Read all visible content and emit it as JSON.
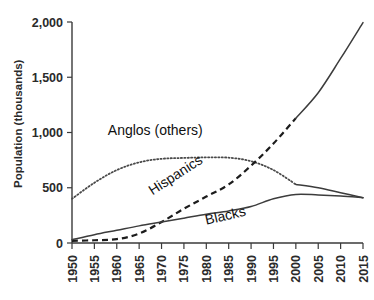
{
  "chart_data": {
    "type": "line",
    "title": "",
    "xlabel": "",
    "ylabel": "Population (thousands)",
    "xlim": [
      1950,
      2015
    ],
    "ylim": [
      0,
      2000
    ],
    "grid": false,
    "legend_position": "inline-annotations",
    "x": [
      1950,
      1955,
      1960,
      1965,
      1970,
      1975,
      1980,
      1985,
      1990,
      1995,
      2000,
      2005,
      2010,
      2015
    ],
    "xticklabels": [
      "1950",
      "1955",
      "1960",
      "1965",
      "1970",
      "1975",
      "1980",
      "1985",
      "1990",
      "1995",
      "2000",
      "2005",
      "2010",
      "2015"
    ],
    "yticks": [
      0,
      500,
      1000,
      1500,
      2000
    ],
    "yticklabels": [
      "0",
      "500",
      "1,000",
      "1,500",
      "2,000"
    ],
    "series": [
      {
        "name": "Anglos (others)",
        "style": "dotted",
        "label": "Anglos (others)",
        "values": [
          400,
          545,
          660,
          730,
          762,
          770,
          775,
          772,
          740,
          660,
          530,
          500,
          455,
          410
        ]
      },
      {
        "name": "Hispanics",
        "style": "dashed",
        "label": "Hispanics",
        "values": [
          20,
          25,
          35,
          85,
          190,
          310,
          420,
          530,
          700,
          900,
          1130,
          1360,
          1670,
          1995
        ]
      },
      {
        "name": "Blacks",
        "style": "solid",
        "label": "Blacks",
        "values": [
          30,
          75,
          115,
          155,
          190,
          225,
          260,
          290,
          330,
          400,
          440,
          435,
          425,
          410
        ]
      }
    ],
    "annotations": [
      {
        "text": "Anglos (others)",
        "x": 1958,
        "y": 980
      },
      {
        "text": "Hispanics",
        "x": 1968,
        "y": 430,
        "rotation": -33
      },
      {
        "text": "Blacks",
        "x": 1980,
        "y": 165,
        "rotation": -13
      }
    ]
  }
}
